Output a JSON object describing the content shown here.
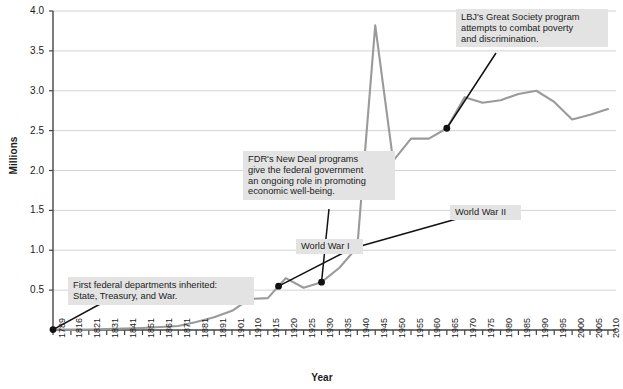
{
  "chart_data": {
    "type": "line",
    "title": "",
    "xlabel": "Year",
    "ylabel": "Millions",
    "ylim": [
      0,
      4.0
    ],
    "ytick_labels": [
      "4.0",
      "3.5",
      "3.0",
      "2.5",
      "2.0",
      "1.5",
      "1.0",
      "0.5"
    ],
    "ytick_values": [
      4.0,
      3.5,
      3.0,
      2.5,
      2.0,
      1.5,
      1.0,
      0.5
    ],
    "grid": "horizontal",
    "legend": "none",
    "line_color": "#9a9a9a",
    "marker_color": "#111111",
    "xtick_labels": [
      "1789",
      "1816",
      "1821",
      "1831",
      "1841",
      "1851",
      "1861",
      "1871",
      "1881",
      "1891",
      "1901",
      "1910",
      "1915",
      "1920",
      "1925",
      "1930",
      "1935",
      "1940",
      "1945",
      "1950",
      "1955",
      "1960",
      "1965",
      "1970",
      "1975",
      "1980",
      "1985",
      "1990",
      "1995",
      "2000",
      "2005",
      "2010"
    ],
    "x": [
      1789,
      1816,
      1821,
      1831,
      1841,
      1851,
      1861,
      1871,
      1881,
      1891,
      1901,
      1910,
      1915,
      1918,
      1920,
      1925,
      1930,
      1935,
      1940,
      1945,
      1950,
      1955,
      1960,
      1965,
      1970,
      1975,
      1980,
      1985,
      1990,
      1995,
      2000,
      2005,
      2010
    ],
    "values": [
      0.005,
      0.005,
      0.007,
      0.011,
      0.018,
      0.026,
      0.037,
      0.051,
      0.1,
      0.16,
      0.24,
      0.39,
      0.4,
      0.55,
      0.65,
      0.53,
      0.6,
      0.78,
      1.04,
      3.82,
      2.12,
      2.4,
      2.4,
      2.53,
      2.92,
      2.85,
      2.88,
      2.96,
      3.0,
      2.86,
      2.64,
      2.7,
      2.77
    ],
    "annotations": [
      {
        "name": "first-federal-departments",
        "text": "First federal departments inherited:\nState, Treasury, and War.",
        "point_year": 1789,
        "point_value": 0.005
      },
      {
        "name": "world-war-i",
        "text": "World War I",
        "point_year": 1918,
        "point_value": 0.55
      },
      {
        "name": "fdr-new-deal",
        "text": "FDR's New Deal programs\ngive the federal government\nan ongoing role in promoting\neconomic well-being.",
        "point_year": 1930,
        "point_value": 0.6
      },
      {
        "name": "world-war-ii",
        "text": "World War II",
        "point_year": 1940,
        "point_value": 1.04
      },
      {
        "name": "lbj-great-society",
        "text": "LBJ's Great Society program\nattempts to combat poverty\nand discrimination.",
        "point_year": 1965,
        "point_value": 2.53
      }
    ]
  },
  "colors": {
    "line": "#9a9a9a",
    "grid": "#d3d3d3",
    "axis": "#444444",
    "callout_bg": "#e3e3e3",
    "text": "#1b1b1b"
  }
}
